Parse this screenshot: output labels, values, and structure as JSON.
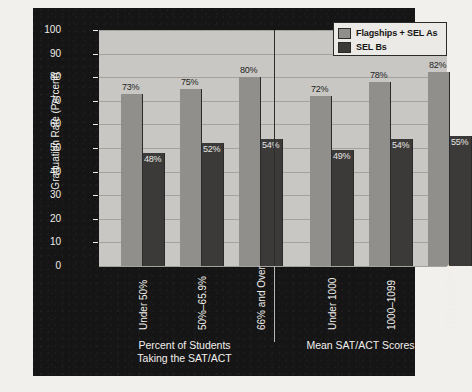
{
  "chart_data": {
    "type": "bar",
    "title": "",
    "xlabel": "",
    "ylabel": "Graduation Rate (Percent)",
    "ylim": [
      0,
      100
    ],
    "ytick_labels": [
      "100",
      "90",
      "80",
      "70",
      "60",
      "50",
      "40",
      "30",
      "20",
      "10",
      "0"
    ],
    "ytick_values": [
      100,
      90,
      80,
      70,
      60,
      50,
      40,
      30,
      20,
      10,
      0
    ],
    "grid": true,
    "legend_position": "top-right",
    "categories": [
      "Under 50%",
      "50%–65.9%",
      "66% and Over",
      "Under 1000",
      "1000–1099",
      "1100 and Over"
    ],
    "series": [
      {
        "name": "Flagships + SEL As",
        "color": "#918f8c",
        "values": [
          73,
          75,
          80,
          72,
          78,
          82
        ],
        "value_labels": [
          "73%",
          "75%",
          "80%",
          "72%",
          "78%",
          "82%"
        ]
      },
      {
        "name": "SEL Bs",
        "color": "#3b3a39",
        "values": [
          48,
          52,
          54,
          49,
          54,
          55
        ],
        "value_labels": [
          "48%",
          "52%",
          "54%",
          "49%",
          "54%",
          "55%"
        ]
      }
    ],
    "groups": [
      {
        "title": "Percent of Students\nTaking the SAT/ACT",
        "category_indices": [
          0,
          1,
          2
        ]
      },
      {
        "title": "Mean SAT/ACT Scores",
        "category_indices": [
          3,
          4,
          5
        ]
      }
    ]
  },
  "legend": {
    "entries": [
      {
        "label": "Flagships + SEL As",
        "swatch": "light"
      },
      {
        "label": "SEL Bs",
        "swatch": "dark"
      }
    ]
  },
  "colors": {
    "panel_background": "#151515",
    "plot_background": "#c9c7c4",
    "gridline": "#a4a29f",
    "light_bar": "#918f8c",
    "dark_bar": "#3b3a39",
    "axis_text": "#efedea",
    "page_background": "#f2f0ec"
  }
}
